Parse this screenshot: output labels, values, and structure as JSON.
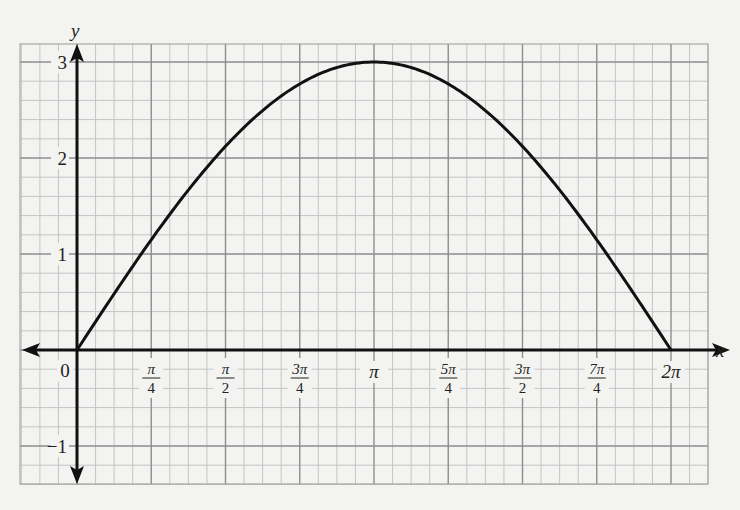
{
  "chart_data": {
    "type": "line",
    "title": "",
    "function": "y = 3 sin(x/2)",
    "xlabel": "x",
    "ylabel": "y",
    "xlim": [
      -0.7,
      6.9
    ],
    "ylim": [
      -1.4,
      3.3
    ],
    "grid": true,
    "legend": null,
    "x_ticks": [
      {
        "value": 0,
        "label": "0"
      },
      {
        "value": 0.7854,
        "num": "π",
        "den": "4"
      },
      {
        "value": 1.5708,
        "num": "π",
        "den": "2"
      },
      {
        "value": 2.3562,
        "num": "3π",
        "den": "4"
      },
      {
        "value": 3.1416,
        "label": "π"
      },
      {
        "value": 3.927,
        "num": "5π",
        "den": "4"
      },
      {
        "value": 4.7124,
        "num": "3π",
        "den": "2"
      },
      {
        "value": 5.4978,
        "num": "7π",
        "den": "4"
      },
      {
        "value": 6.2832,
        "label": "2π"
      }
    ],
    "y_ticks": [
      {
        "value": 3,
        "label": "3"
      },
      {
        "value": 2,
        "label": "2"
      },
      {
        "value": 1,
        "label": "1"
      },
      {
        "value": -1,
        "label": "−1"
      }
    ],
    "series": [
      {
        "name": "y = 3 sin(x/2)",
        "x": [
          0,
          0.7854,
          1.5708,
          2.3562,
          3.1416,
          3.927,
          4.7124,
          5.4978,
          6.2832
        ],
        "y": [
          0,
          1.15,
          2.12,
          2.77,
          3.0,
          2.77,
          2.12,
          1.15,
          0
        ]
      }
    ]
  },
  "axes": {
    "x_label": "x",
    "y_label": "y",
    "origin_label": "0"
  }
}
